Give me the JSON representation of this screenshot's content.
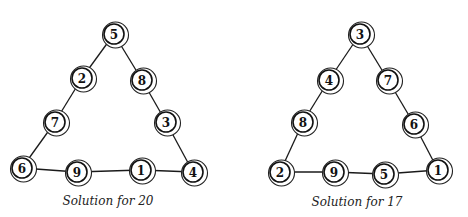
{
  "diagrams": [
    {
      "caption": "Solution for 20",
      "caption_pos": [
        108,
        194
      ],
      "nodes": [
        {
          "label": "5",
          "x": 114,
          "y": 34
        },
        {
          "label": "2",
          "x": 82,
          "y": 78
        },
        {
          "label": "8",
          "x": 142,
          "y": 80
        },
        {
          "label": "7",
          "x": 55,
          "y": 122
        },
        {
          "label": "3",
          "x": 166,
          "y": 122
        },
        {
          "label": "6",
          "x": 22,
          "y": 168
        },
        {
          "label": "9",
          "x": 77,
          "y": 172
        },
        {
          "label": "1",
          "x": 141,
          "y": 170
        },
        {
          "label": "4",
          "x": 193,
          "y": 172
        }
      ],
      "edges": [
        [
          0,
          1
        ],
        [
          1,
          3
        ],
        [
          3,
          5
        ],
        [
          0,
          2
        ],
        [
          2,
          4
        ],
        [
          4,
          8
        ],
        [
          5,
          6
        ],
        [
          6,
          7
        ],
        [
          7,
          8
        ]
      ]
    },
    {
      "caption": "Solution for 17",
      "caption_pos": [
        357,
        195
      ],
      "nodes": [
        {
          "label": "3",
          "x": 360,
          "y": 34
        },
        {
          "label": "4",
          "x": 329,
          "y": 80
        },
        {
          "label": "7",
          "x": 388,
          "y": 80
        },
        {
          "label": "8",
          "x": 303,
          "y": 122
        },
        {
          "label": "6",
          "x": 414,
          "y": 124
        },
        {
          "label": "2",
          "x": 280,
          "y": 172
        },
        {
          "label": "9",
          "x": 334,
          "y": 172
        },
        {
          "label": "5",
          "x": 384,
          "y": 174
        },
        {
          "label": "1",
          "x": 438,
          "y": 170
        }
      ],
      "edges": [
        [
          0,
          1
        ],
        [
          1,
          3
        ],
        [
          3,
          5
        ],
        [
          0,
          2
        ],
        [
          2,
          4
        ],
        [
          4,
          8
        ],
        [
          5,
          6
        ],
        [
          6,
          7
        ],
        [
          7,
          8
        ]
      ]
    }
  ]
}
